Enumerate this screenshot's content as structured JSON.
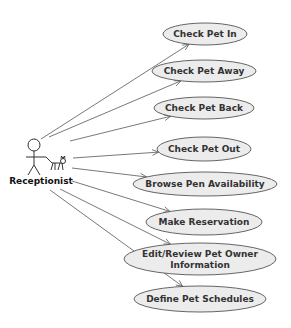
{
  "diagram": {
    "type": "uml-use-case",
    "actor": {
      "label": "Receptionist",
      "icon": "stick-figure-with-cat-icon"
    },
    "use_cases": [
      {
        "id": "uc1",
        "label_lines": [
          "Check Pet In"
        ],
        "cx": 205,
        "cy": 34,
        "rx": 42,
        "ry": 11,
        "from": [
          41,
          139
        ]
      },
      {
        "id": "uc2",
        "label_lines": [
          "Check Pet Away"
        ],
        "cx": 204,
        "cy": 71,
        "rx": 52,
        "ry": 11,
        "from": [
          49,
          137
        ]
      },
      {
        "id": "uc3",
        "label_lines": [
          "Check Pet Back"
        ],
        "cx": 204,
        "cy": 108,
        "rx": 50,
        "ry": 11,
        "from": [
          70,
          141
        ]
      },
      {
        "id": "uc4",
        "label_lines": [
          "Check Pet Out"
        ],
        "cx": 204,
        "cy": 149,
        "rx": 47,
        "ry": 12,
        "from": [
          73,
          158
        ]
      },
      {
        "id": "uc5",
        "label_lines": [
          "Browse Pen Availability"
        ],
        "cx": 205,
        "cy": 184,
        "rx": 72,
        "ry": 12,
        "from": [
          72,
          168
        ]
      },
      {
        "id": "uc6",
        "label_lines": [
          "Make Reservation"
        ],
        "cx": 204,
        "cy": 222,
        "rx": 58,
        "ry": 13,
        "from": [
          72,
          181
        ]
      },
      {
        "id": "uc7",
        "label_lines": [
          "Edit/Review Pet Owner",
          "Information"
        ],
        "cx": 200,
        "cy": 259,
        "rx": 76,
        "ry": 16,
        "from": [
          60,
          189
        ]
      },
      {
        "id": "uc8",
        "label_lines": [
          "Define Pet Schedules"
        ],
        "cx": 200,
        "cy": 299,
        "rx": 66,
        "ry": 13,
        "from": [
          50,
          190
        ]
      }
    ],
    "colors": {
      "ellipse_fill": "#ececec",
      "ellipse_stroke": "#555555",
      "line": "#555555",
      "text": "#333333"
    }
  }
}
